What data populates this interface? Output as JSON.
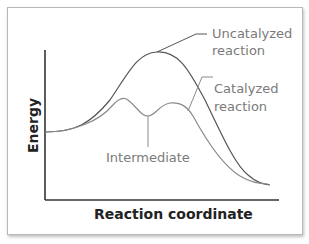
{
  "diagram": {
    "title": "",
    "axes": {
      "x_label": "Reaction coordinate",
      "y_label": "Energy"
    },
    "curves": [
      {
        "name": "uncatalyzed",
        "label_line1": "Uncatalyzed",
        "label_line2": "reaction",
        "color": "#555555"
      },
      {
        "name": "catalyzed",
        "label_line1": "Catalyzed",
        "label_line2": "reaction",
        "color": "#8a8a8a"
      }
    ],
    "annotations": {
      "intermediate": "Intermediate"
    },
    "colors": {
      "axis": "#333333",
      "label_text": "#7a7a7a",
      "axis_text": "#222222",
      "border": "#b8b8b8"
    }
  }
}
